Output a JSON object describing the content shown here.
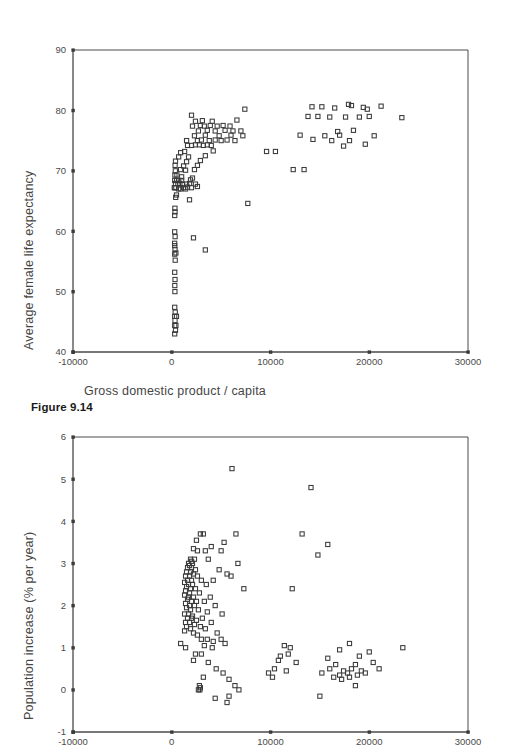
{
  "page": {
    "background": "#ffffff",
    "width": 508,
    "height": 754
  },
  "figure1": {
    "caption": "Figure 9.14",
    "xlabel": "Gross domestic product / capita",
    "ylabel": "Average female life expectancy"
  },
  "figure2": {
    "xlabel": "Gross domestic product / capita",
    "ylabel": "Population increase (% per year)"
  },
  "chart_data": [
    {
      "type": "scatter",
      "title": "",
      "xlabel": "Gross domestic product / capita",
      "ylabel": "Average female life expectancy",
      "xlim": [
        -10000,
        30000
      ],
      "ylim": [
        40,
        90
      ],
      "xticks": [
        -10000,
        0,
        10000,
        20000,
        30000
      ],
      "yticks": [
        40,
        50,
        60,
        70,
        80,
        90
      ],
      "xticklabels": [
        "-10000",
        "0",
        "10000",
        "20000",
        "30000"
      ],
      "yticklabels": [
        "40",
        "50",
        "60",
        "70",
        "80",
        "90"
      ],
      "grid": false,
      "legend": false,
      "marker": "open-square",
      "marker_color": "#3a3a3a",
      "points": [
        [
          300,
          43.0
        ],
        [
          380,
          43.6
        ],
        [
          300,
          44.4
        ],
        [
          420,
          44.4
        ],
        [
          330,
          45.2
        ],
        [
          300,
          45.9
        ],
        [
          480,
          45.9
        ],
        [
          350,
          46.6
        ],
        [
          300,
          47.4
        ],
        [
          320,
          50.0
        ],
        [
          310,
          51.0
        ],
        [
          330,
          52.0
        ],
        [
          300,
          53.2
        ],
        [
          350,
          55.2
        ],
        [
          300,
          56.2
        ],
        [
          420,
          56.4
        ],
        [
          330,
          57.0
        ],
        [
          300,
          57.6
        ],
        [
          290,
          58.0
        ],
        [
          340,
          59.1
        ],
        [
          300,
          59.9
        ],
        [
          3400,
          56.9
        ],
        [
          2200,
          58.9
        ],
        [
          300,
          62.6
        ],
        [
          330,
          63.2
        ],
        [
          320,
          63.8
        ],
        [
          7700,
          64.6
        ],
        [
          400,
          65.6
        ],
        [
          480,
          66.0
        ],
        [
          1800,
          65.2
        ],
        [
          260,
          67.2
        ],
        [
          320,
          67.2
        ],
        [
          420,
          67.2
        ],
        [
          700,
          67.0
        ],
        [
          900,
          67.0
        ],
        [
          1200,
          67.2
        ],
        [
          1400,
          67.0
        ],
        [
          1600,
          67.3
        ],
        [
          2000,
          67.2
        ],
        [
          2600,
          67.4
        ],
        [
          380,
          67.9
        ],
        [
          620,
          67.9
        ],
        [
          820,
          67.9
        ],
        [
          1100,
          67.8
        ],
        [
          1500,
          67.8
        ],
        [
          1800,
          67.9
        ],
        [
          2400,
          67.8
        ],
        [
          300,
          68.4
        ],
        [
          500,
          68.4
        ],
        [
          700,
          68.4
        ],
        [
          1000,
          68.4
        ],
        [
          1900,
          68.5
        ],
        [
          320,
          69.3
        ],
        [
          520,
          69.3
        ],
        [
          1000,
          69.0
        ],
        [
          2100,
          68.8
        ],
        [
          360,
          70.0
        ],
        [
          900,
          70.2
        ],
        [
          1400,
          70.1
        ],
        [
          2300,
          70.2
        ],
        [
          340,
          70.9
        ],
        [
          1200,
          70.8
        ],
        [
          2600,
          70.9
        ],
        [
          12300,
          70.2
        ],
        [
          13400,
          70.2
        ],
        [
          380,
          71.6
        ],
        [
          1500,
          71.5
        ],
        [
          2900,
          71.7
        ],
        [
          700,
          72.3
        ],
        [
          1700,
          72.3
        ],
        [
          3400,
          72.5
        ],
        [
          900,
          73.0
        ],
        [
          1300,
          73.2
        ],
        [
          4200,
          73.3
        ],
        [
          9600,
          73.2
        ],
        [
          10500,
          73.2
        ],
        [
          1600,
          74.2
        ],
        [
          2000,
          74.2
        ],
        [
          2400,
          74.3
        ],
        [
          2800,
          74.3
        ],
        [
          3200,
          74.2
        ],
        [
          3600,
          74.3
        ],
        [
          4000,
          74.2
        ],
        [
          17400,
          74.1
        ],
        [
          19600,
          74.4
        ],
        [
          1500,
          75.0
        ],
        [
          2600,
          75.0
        ],
        [
          3000,
          75.1
        ],
        [
          3800,
          75.0
        ],
        [
          4400,
          75.1
        ],
        [
          5000,
          75.0
        ],
        [
          5600,
          75.1
        ],
        [
          6400,
          75.0
        ],
        [
          14300,
          75.2
        ],
        [
          16200,
          75.0
        ],
        [
          18000,
          75.0
        ],
        [
          2300,
          75.8
        ],
        [
          3400,
          75.9
        ],
        [
          4800,
          75.8
        ],
        [
          6000,
          75.9
        ],
        [
          7200,
          75.8
        ],
        [
          13000,
          75.9
        ],
        [
          15500,
          75.8
        ],
        [
          17000,
          75.9
        ],
        [
          20500,
          75.8
        ],
        [
          2700,
          76.6
        ],
        [
          3600,
          76.7
        ],
        [
          4400,
          76.6
        ],
        [
          5400,
          76.7
        ],
        [
          6200,
          76.6
        ],
        [
          7000,
          76.6
        ],
        [
          16800,
          76.5
        ],
        [
          18400,
          76.7
        ],
        [
          2100,
          77.4
        ],
        [
          2900,
          77.5
        ],
        [
          3300,
          77.4
        ],
        [
          3900,
          77.5
        ],
        [
          4600,
          77.4
        ],
        [
          5200,
          77.5
        ],
        [
          5900,
          77.4
        ],
        [
          2400,
          78.2
        ],
        [
          3100,
          78.3
        ],
        [
          4100,
          78.2
        ],
        [
          6600,
          78.4
        ],
        [
          13800,
          79.0
        ],
        [
          14800,
          79.0
        ],
        [
          16000,
          78.9
        ],
        [
          17600,
          78.9
        ],
        [
          19000,
          78.9
        ],
        [
          20000,
          79.0
        ],
        [
          23300,
          78.8
        ],
        [
          2000,
          79.2
        ],
        [
          7400,
          80.2
        ],
        [
          14200,
          80.6
        ],
        [
          16500,
          80.4
        ],
        [
          18200,
          80.8
        ],
        [
          19400,
          80.5
        ],
        [
          21200,
          80.7
        ],
        [
          15200,
          80.6
        ],
        [
          17900,
          81.0
        ],
        [
          19800,
          80.2
        ]
      ]
    },
    {
      "type": "scatter",
      "title": "",
      "xlabel": "Gross domestic product / capita",
      "ylabel": "Population increase (% per year)",
      "xlim": [
        -10000,
        30000
      ],
      "ylim": [
        -1,
        6
      ],
      "xticks": [
        -10000,
        0,
        10000,
        20000,
        30000
      ],
      "yticks": [
        -1,
        0,
        1,
        2,
        3,
        4,
        5,
        6
      ],
      "xticklabels": [
        "-10000",
        "0",
        "10000",
        "20000",
        "30000"
      ],
      "yticklabels": [
        "-1",
        "0",
        "1",
        "2",
        "3",
        "4",
        "5",
        "6"
      ],
      "grid": false,
      "legend": false,
      "marker": "open-square",
      "marker_color": "#3a3a3a",
      "points": [
        [
          6100,
          5.25
        ],
        [
          14100,
          4.8
        ],
        [
          2900,
          3.7
        ],
        [
          3200,
          3.7
        ],
        [
          6500,
          3.7
        ],
        [
          13200,
          3.7
        ],
        [
          2500,
          3.55
        ],
        [
          5300,
          3.5
        ],
        [
          15800,
          3.45
        ],
        [
          4000,
          3.4
        ],
        [
          2200,
          3.35
        ],
        [
          2600,
          3.3
        ],
        [
          3400,
          3.3
        ],
        [
          5000,
          3.3
        ],
        [
          14800,
          3.2
        ],
        [
          1900,
          3.1
        ],
        [
          2300,
          3.1
        ],
        [
          2000,
          3.05
        ],
        [
          3700,
          3.1
        ],
        [
          1700,
          3.0
        ],
        [
          2100,
          3.0
        ],
        [
          1800,
          2.95
        ],
        [
          6700,
          3.0
        ],
        [
          1600,
          2.9
        ],
        [
          2000,
          2.9
        ],
        [
          2400,
          2.85
        ],
        [
          4800,
          2.85
        ],
        [
          1500,
          2.8
        ],
        [
          1900,
          2.8
        ],
        [
          2200,
          2.75
        ],
        [
          5600,
          2.75
        ],
        [
          1400,
          2.7
        ],
        [
          1800,
          2.7
        ],
        [
          2600,
          2.7
        ],
        [
          6000,
          2.7
        ],
        [
          1600,
          2.6
        ],
        [
          2000,
          2.6
        ],
        [
          3000,
          2.6
        ],
        [
          4200,
          2.6
        ],
        [
          1300,
          2.55
        ],
        [
          1700,
          2.5
        ],
        [
          2100,
          2.5
        ],
        [
          3500,
          2.5
        ],
        [
          1500,
          2.45
        ],
        [
          1900,
          2.4
        ],
        [
          2400,
          2.4
        ],
        [
          12200,
          2.4
        ],
        [
          1400,
          2.35
        ],
        [
          1800,
          2.3
        ],
        [
          2800,
          2.3
        ],
        [
          7300,
          2.4
        ],
        [
          1300,
          2.25
        ],
        [
          1700,
          2.2
        ],
        [
          2200,
          2.2
        ],
        [
          3900,
          2.2
        ],
        [
          1600,
          2.15
        ],
        [
          2000,
          2.1
        ],
        [
          2500,
          2.1
        ],
        [
          3300,
          2.1
        ],
        [
          1400,
          2.05
        ],
        [
          1800,
          2.0
        ],
        [
          2300,
          2.0
        ],
        [
          4400,
          2.0
        ],
        [
          1500,
          1.95
        ],
        [
          1900,
          1.9
        ],
        [
          2700,
          1.9
        ],
        [
          3600,
          1.85
        ],
        [
          1300,
          1.8
        ],
        [
          1700,
          1.8
        ],
        [
          2100,
          1.75
        ],
        [
          5100,
          1.8
        ],
        [
          1600,
          1.7
        ],
        [
          2000,
          1.7
        ],
        [
          2500,
          1.65
        ],
        [
          3100,
          1.7
        ],
        [
          1400,
          1.6
        ],
        [
          1800,
          1.6
        ],
        [
          2300,
          1.55
        ],
        [
          4000,
          1.6
        ],
        [
          1500,
          1.5
        ],
        [
          1900,
          1.45
        ],
        [
          2900,
          1.5
        ],
        [
          3400,
          1.45
        ],
        [
          1300,
          1.4
        ],
        [
          2200,
          1.35
        ],
        [
          2600,
          1.3
        ],
        [
          4600,
          1.35
        ],
        [
          3000,
          1.2
        ],
        [
          3600,
          1.2
        ],
        [
          4200,
          1.15
        ],
        [
          5000,
          1.2
        ],
        [
          900,
          1.1
        ],
        [
          3300,
          1.05
        ],
        [
          5400,
          1.1
        ],
        [
          18000,
          1.1
        ],
        [
          1400,
          1.0
        ],
        [
          4100,
          1.0
        ],
        [
          11400,
          1.05
        ],
        [
          12000,
          1.0
        ],
        [
          17000,
          0.95
        ],
        [
          20000,
          0.9
        ],
        [
          23400,
          1.0
        ],
        [
          2400,
          0.85
        ],
        [
          3000,
          0.85
        ],
        [
          11000,
          0.8
        ],
        [
          11800,
          0.85
        ],
        [
          15800,
          0.75
        ],
        [
          19000,
          0.8
        ],
        [
          2200,
          0.7
        ],
        [
          3700,
          0.65
        ],
        [
          10800,
          0.7
        ],
        [
          12600,
          0.65
        ],
        [
          16600,
          0.6
        ],
        [
          18600,
          0.6
        ],
        [
          20400,
          0.65
        ],
        [
          4500,
          0.5
        ],
        [
          10400,
          0.5
        ],
        [
          11600,
          0.45
        ],
        [
          16000,
          0.5
        ],
        [
          17400,
          0.45
        ],
        [
          18200,
          0.5
        ],
        [
          19200,
          0.45
        ],
        [
          21000,
          0.5
        ],
        [
          5200,
          0.4
        ],
        [
          9800,
          0.4
        ],
        [
          15200,
          0.4
        ],
        [
          17000,
          0.35
        ],
        [
          17800,
          0.4
        ],
        [
          18800,
          0.35
        ],
        [
          19600,
          0.4
        ],
        [
          3200,
          0.3
        ],
        [
          5800,
          0.25
        ],
        [
          10200,
          0.3
        ],
        [
          16400,
          0.3
        ],
        [
          17200,
          0.25
        ],
        [
          18000,
          0.3
        ],
        [
          2800,
          0.1
        ],
        [
          2900,
          0.05
        ],
        [
          6400,
          0.1
        ],
        [
          18600,
          0.1
        ],
        [
          2700,
          0.0
        ],
        [
          2850,
          0.0
        ],
        [
          6800,
          0.0
        ],
        [
          4400,
          -0.2
        ],
        [
          5800,
          -0.15
        ],
        [
          15000,
          -0.15
        ],
        [
          5600,
          -0.3
        ]
      ]
    }
  ]
}
